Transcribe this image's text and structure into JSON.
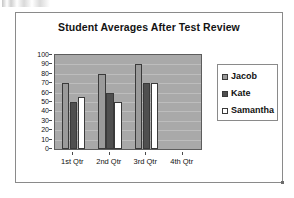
{
  "chart_data": {
    "type": "bar",
    "title": "Student Averages After Test Review",
    "xlabel": "",
    "ylabel": "",
    "categories": [
      "1st Qtr",
      "2nd Qtr",
      "3rd Qtr",
      "4th Qtr"
    ],
    "series": [
      {
        "name": "Jacob",
        "values": [
          70,
          80,
          90,
          0
        ],
        "color": "#9a9a9a"
      },
      {
        "name": "Kate",
        "values": [
          50,
          60,
          70,
          0
        ],
        "color": "#4f4f4f"
      },
      {
        "name": "Samantha",
        "values": [
          55,
          50,
          70,
          0
        ],
        "color": "#ffffff"
      }
    ],
    "ylim": [
      0,
      100
    ],
    "ytick_step": 10,
    "yticks": [
      "100",
      "90",
      "80",
      "70",
      "60",
      "50",
      "40",
      "30",
      "20",
      "10",
      "0"
    ],
    "grid": true,
    "legend_position": "right",
    "plot_background": "#a9a9a9",
    "gridline_color": "#bdbdbd"
  },
  "legend": {
    "entries": [
      {
        "label": "Jacob"
      },
      {
        "label": "Kate"
      },
      {
        "label": "Samantha"
      }
    ]
  }
}
